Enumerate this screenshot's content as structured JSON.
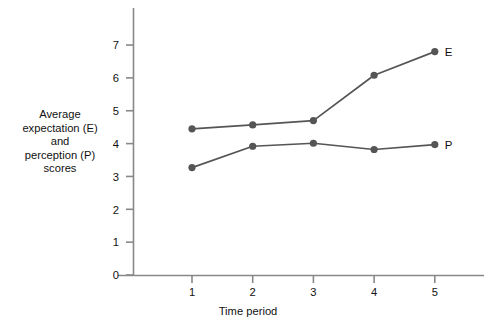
{
  "chart_data": {
    "type": "line",
    "title": "",
    "subtitle": "",
    "xlabel": "Time period",
    "ylabel": "Average\nexpectation (E)\nand\nperception (P)\nscores",
    "x": [
      1,
      2,
      3,
      4,
      5
    ],
    "categories": [
      "1",
      "2",
      "3",
      "4",
      "5"
    ],
    "xtick_labels": [
      "1",
      "2",
      "3",
      "4",
      "5"
    ],
    "ytick_labels": [
      "0",
      "1",
      "2",
      "3",
      "4",
      "5",
      "6",
      "7"
    ],
    "xlim": [
      0.45,
      5.6
    ],
    "ylim": [
      0,
      7.45
    ],
    "grid": false,
    "legend_position": "end-of-line",
    "series": [
      {
        "name": "E",
        "end_label": "E",
        "color": "#555555",
        "marker": "circle",
        "values": [
          4.45,
          4.57,
          4.7,
          6.08,
          6.8
        ]
      },
      {
        "name": "P",
        "end_label": "P",
        "color": "#555555",
        "marker": "circle",
        "values": [
          3.27,
          3.92,
          4.01,
          3.82,
          3.97
        ]
      }
    ],
    "colors": {
      "series_line": "#555555",
      "marker_fill": "#555555",
      "axis": "#888888",
      "text": "#111111",
      "background": "#ffffff"
    }
  }
}
